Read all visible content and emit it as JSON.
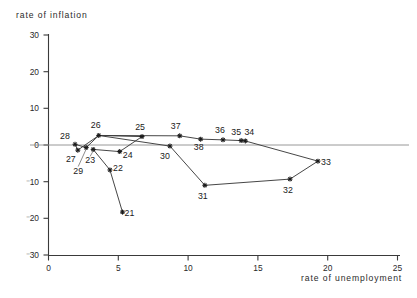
{
  "chart_data": {
    "type": "line",
    "title": "",
    "xlabel": "rate of unemployment",
    "ylabel": "rate of inflation",
    "xlim": [
      0,
      25
    ],
    "ylim": [
      -30,
      30
    ],
    "xticks": [
      0,
      5,
      10,
      15,
      20,
      25
    ],
    "xtick_labels": [
      "0",
      "5",
      "10",
      "15",
      "20",
      "25"
    ],
    "yticks": [
      -30,
      -20,
      -10,
      0,
      10,
      20,
      30
    ],
    "ytick_labels": [
      "⁻30",
      "⁻20",
      "⁻10",
      "0",
      "10",
      "20",
      "30"
    ],
    "grid": false,
    "legend": false,
    "zero_line": true,
    "series": [
      {
        "name": "Phillips curve path",
        "point_labels": [
          "21",
          "22",
          "23",
          "24",
          "25",
          "26",
          "27",
          "28",
          "29",
          "30",
          "31",
          "32",
          "33",
          "34",
          "35",
          "36",
          "37",
          "38"
        ],
        "x": [
          5.3,
          4.4,
          3.2,
          5.1,
          6.7,
          3.6,
          2.1,
          1.9,
          2.7,
          8.7,
          11.2,
          17.3,
          19.3,
          14.1,
          13.8,
          12.5,
          9.4,
          10.9
        ],
        "y": [
          -18.3,
          -6.8,
          -1.2,
          -1.8,
          2.3,
          2.6,
          -1.4,
          0.2,
          -0.7,
          -0.3,
          -11.0,
          -9.3,
          -4.4,
          1.1,
          1.2,
          1.4,
          2.5,
          1.6
        ]
      }
    ],
    "connections": [
      [
        "21",
        "22"
      ],
      [
        "22",
        "23"
      ],
      [
        "23",
        "24"
      ],
      [
        "24",
        "25"
      ],
      [
        "25",
        "26"
      ],
      [
        "26",
        "27"
      ],
      [
        "27",
        "28"
      ],
      [
        "28",
        "29"
      ],
      [
        "29",
        "26"
      ],
      [
        "26",
        "37"
      ],
      [
        "37",
        "38"
      ],
      [
        "38",
        "36"
      ],
      [
        "36",
        "35"
      ],
      [
        "35",
        "34"
      ],
      [
        "34",
        "33"
      ],
      [
        "33",
        "32"
      ],
      [
        "32",
        "31"
      ],
      [
        "31",
        "30"
      ],
      [
        "30",
        "26"
      ]
    ]
  },
  "axis": {
    "y_title": "rate of inflation",
    "x_title": "rate of unemployment"
  }
}
